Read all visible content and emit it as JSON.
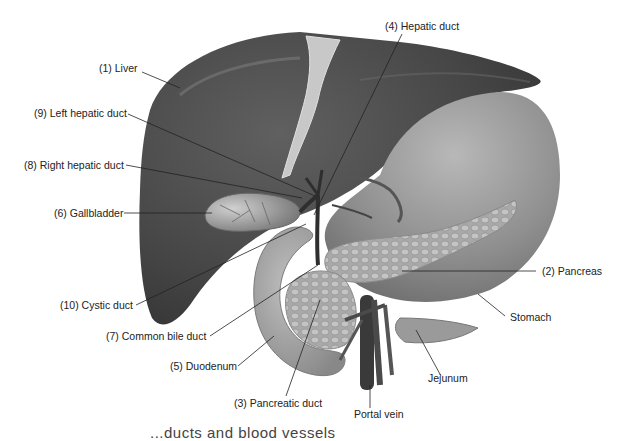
{
  "figure": {
    "type": "anatomical-illustration",
    "colors": {
      "liver": "#4a4a4a",
      "liver_highlight": "#6a6a6a",
      "stomach": "#9a9a9a",
      "pancreas": "#b0b0b0",
      "duodenum": "#a8a8a8",
      "gallbladder": "#8c8c8c",
      "ligament": "#c8c8c8",
      "vessel": "#3a3a3a",
      "leader_line": "#222222",
      "label_text": "#222222"
    }
  },
  "labels": {
    "liver": "(1) Liver",
    "left_hepatic_duct": "(9) Left hepatic duct",
    "right_hepatic_duct": "(8) Right hepatic duct",
    "gallbladder": "(6) Gallbladder",
    "cystic_duct": "(10) Cystic duct",
    "common_bile_duct": "(7) Common bile duct",
    "duodenum": "(5) Duodenum",
    "pancreatic_duct": "(3) Pancreatic duct",
    "portal_vein": "Portal vein",
    "jejunum": "Jejunum",
    "stomach": "Stomach",
    "pancreas": "(2) Pancreas",
    "hepatic_duct": "(4) Hepatic duct"
  },
  "caption": {
    "text": "...ducts and blood vessels",
    "note": "partially cut off at bottom edge"
  }
}
